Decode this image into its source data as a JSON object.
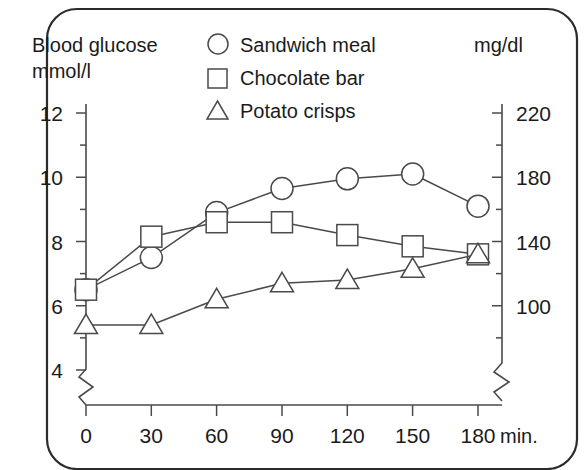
{
  "figure": {
    "left_axis_title_line1": "Blood glucose",
    "left_axis_title_line2": "mmol/l",
    "right_axis_title": "mg/dl",
    "x_unit_label": "min."
  },
  "legend": {
    "position": "top-center",
    "entries": [
      {
        "marker": "circle-marker-icon",
        "label": "Sandwich meal"
      },
      {
        "marker": "square-marker-icon",
        "label": "Chocolate bar"
      },
      {
        "marker": "triangle-marker-icon",
        "label": "Potato crisps"
      }
    ]
  },
  "colors": {
    "line": "#4a4a4a",
    "text": "#1b1b1b",
    "frame": "#2b2b2b",
    "background": "#ffffff",
    "marker_fill": "#ffffff"
  },
  "chart_data": {
    "type": "line",
    "title": "",
    "subtitle": "",
    "xlabel": "min.",
    "ylabel": "Blood glucose mmol/l",
    "y2label": "mg/dl",
    "x": [
      0,
      30,
      60,
      90,
      120,
      150,
      180
    ],
    "xtick_labels": [
      "0",
      "30",
      "60",
      "90",
      "120",
      "150",
      "180"
    ],
    "xlim": [
      0,
      180
    ],
    "ylim": [
      3.4,
      12.6
    ],
    "ytick_labels": [
      "12",
      "10",
      "8",
      "6",
      "4"
    ],
    "yticks": [
      12,
      10,
      8,
      6,
      4
    ],
    "y_minor_ticks": [
      11,
      9,
      7,
      5,
      4.2
    ],
    "y2tick_labels": [
      "220",
      "180",
      "140",
      "100"
    ],
    "y2ticks": [
      220,
      180,
      140,
      100
    ],
    "y2_minor_ticks": [
      200,
      160,
      120,
      80
    ],
    "grid": false,
    "axis_break_x": true,
    "axis_break_y": true,
    "legend_position": "top-center",
    "series": [
      {
        "name": "Sandwich meal",
        "marker": "circle",
        "values": [
          6.5,
          7.5,
          8.9,
          9.65,
          9.95,
          10.1,
          9.1
        ]
      },
      {
        "name": "Chocolate bar",
        "marker": "square",
        "values": [
          6.5,
          8.15,
          8.6,
          8.6,
          8.2,
          7.85,
          7.6
        ]
      },
      {
        "name": "Potato crisps",
        "marker": "triangle",
        "values": [
          5.4,
          5.4,
          6.2,
          6.7,
          6.8,
          7.15,
          7.6
        ]
      }
    ]
  }
}
